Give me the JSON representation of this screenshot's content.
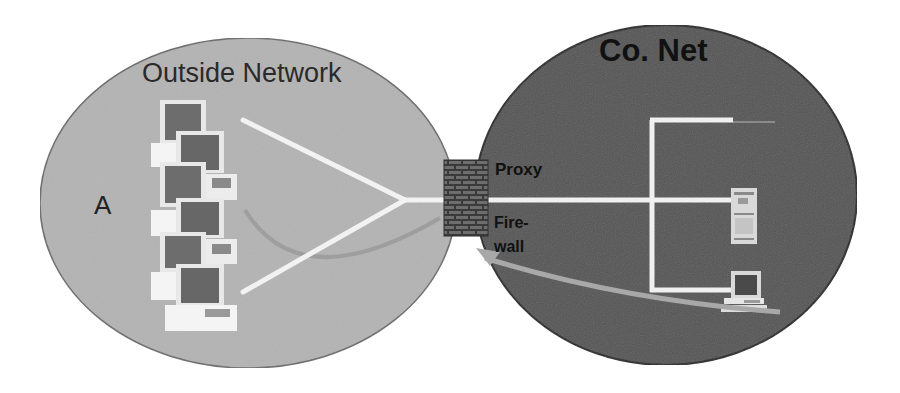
{
  "diagram": {
    "type": "network-topology",
    "outside_network": {
      "title": "Outside Network",
      "host_label": "A",
      "fill_color": "#b4b4b4",
      "computer_count": 6,
      "small_laptop_count": 2
    },
    "company_network": {
      "title": "Co. Net",
      "fill_color": "#555555",
      "devices": [
        "branch-endpoint-top",
        "server-tower",
        "laptop-workstation"
      ]
    },
    "gateway": {
      "proxy_label": "Proxy",
      "firewall_label_line1": "Fire-",
      "firewall_label_line2": "wall",
      "wall_color": "#3c3c3c"
    },
    "connections": {
      "line_color": "#f2f2f2",
      "arrow_color_outside": "#9a9a9a",
      "arrow_color_inside": "#a8a8a8"
    },
    "colors": {
      "background": "#ffffff",
      "outline": "#2b2b2b"
    }
  }
}
